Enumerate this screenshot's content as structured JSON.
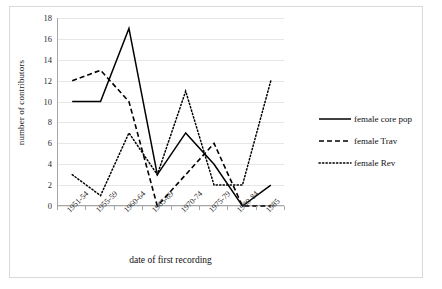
{
  "chart_data": {
    "type": "line",
    "title": "",
    "xlabel": "date of first recording",
    "ylabel": "number of contributors",
    "categories": [
      "1951-54",
      "1955-59",
      "1960-64",
      "1965-69",
      "1970-74",
      "1975-79",
      "1980-84",
      "1985"
    ],
    "ylim": [
      0,
      18
    ],
    "yticks": [
      0,
      2,
      4,
      6,
      8,
      10,
      12,
      14,
      16,
      18
    ],
    "grid": true,
    "legend_position": "right",
    "series": [
      {
        "name": "female core pop",
        "style": "solid",
        "color": "#000000",
        "values": [
          10,
          10,
          17,
          3,
          7,
          4,
          0,
          2
        ]
      },
      {
        "name": "female Trav",
        "style": "dashed",
        "color": "#000000",
        "values": [
          12,
          13,
          10,
          0,
          3,
          6,
          0,
          0
        ]
      },
      {
        "name": "female Rev",
        "style": "dotted",
        "color": "#000000",
        "values": [
          3,
          1,
          7,
          3,
          11,
          2,
          2,
          12
        ]
      }
    ]
  },
  "axis": {
    "ytick_labels": [
      "18",
      "16",
      "14",
      "12",
      "10",
      "8",
      "6",
      "4",
      "2",
      "0"
    ],
    "y_title": "number of contributors",
    "x_title": "date of first recording"
  },
  "legend": {
    "items": [
      {
        "label": "female core pop",
        "style": "solid"
      },
      {
        "label": "female Trav",
        "style": "dashed"
      },
      {
        "label": "female Rev",
        "style": "dotted"
      }
    ]
  }
}
